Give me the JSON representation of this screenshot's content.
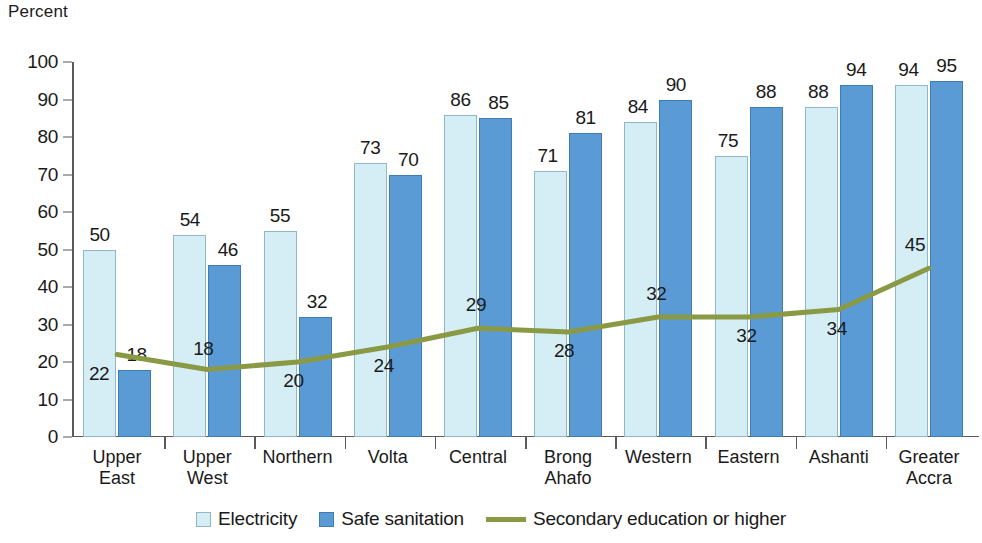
{
  "axis": {
    "y_title": "Percent",
    "y_ticks": [
      "0",
      "10",
      "20",
      "30",
      "40",
      "50",
      "60",
      "70",
      "80",
      "90",
      "100"
    ]
  },
  "legend": {
    "items": [
      {
        "label": "Electricity",
        "type": "swatch",
        "color": "#d5eef6"
      },
      {
        "label": "Safe sanitation",
        "type": "swatch",
        "color": "#5b9bd5"
      },
      {
        "label": "Secondary education or higher",
        "type": "line",
        "color": "#8a9a44"
      }
    ]
  },
  "chart_data": {
    "type": "bar",
    "title": "",
    "subtitle": "",
    "xlabel": "",
    "ylabel": "Percent",
    "ylim": [
      0,
      100
    ],
    "ytick_step": 10,
    "grid": false,
    "legend_position": "bottom",
    "categories": [
      "Upper\nEast",
      "Upper\nWest",
      "Northern",
      "Volta",
      "Central",
      "Brong\nAhafo",
      "Western",
      "Eastern",
      "Ashanti",
      "Greater\nAccra"
    ],
    "series": [
      {
        "name": "Electricity",
        "type": "bar",
        "color": "#d5eef6",
        "values": [
          50,
          54,
          55,
          73,
          86,
          71,
          84,
          75,
          88,
          94
        ]
      },
      {
        "name": "Safe sanitation",
        "type": "bar",
        "color": "#5b9bd5",
        "values": [
          18,
          46,
          32,
          70,
          85,
          81,
          90,
          88,
          94,
          95
        ]
      },
      {
        "name": "Secondary education or higher",
        "type": "line",
        "color": "#8a9a44",
        "values": [
          22,
          18,
          20,
          24,
          29,
          28,
          32,
          32,
          34,
          45
        ]
      }
    ]
  }
}
